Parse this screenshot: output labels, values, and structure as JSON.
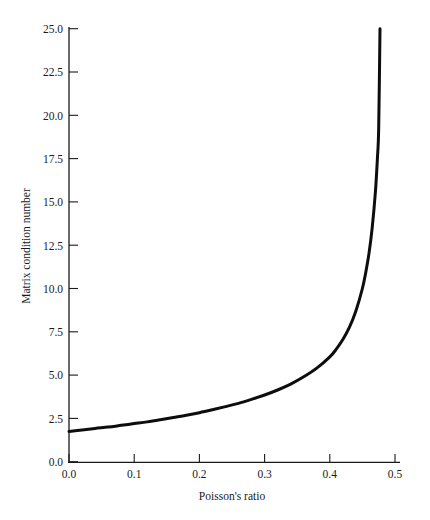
{
  "chart_data": {
    "type": "line",
    "title": "",
    "xlabel": "Poisson's ratio",
    "ylabel": "Matrix condition number",
    "xlim": [
      0.0,
      0.52
    ],
    "ylim": [
      0.0,
      25.0
    ],
    "xticks": [
      0.0,
      0.1,
      0.2,
      0.3,
      0.4,
      0.5
    ],
    "xtick_labels": [
      "0.0",
      "0.1",
      "0.2",
      "0.3",
      "0.4",
      "0.5"
    ],
    "yticks": [
      0.0,
      2.5,
      5.0,
      7.5,
      10.0,
      12.5,
      15.0,
      17.5,
      20.0,
      22.5,
      25.0
    ],
    "ytick_labels": [
      "0.0",
      "2.5",
      "5.0",
      "7.5",
      "10.0",
      "12.5",
      "15.0",
      "17.5",
      "20.0",
      "22.5",
      "25.0"
    ],
    "grid": false,
    "legend": null,
    "legend_position": "none",
    "series": [
      {
        "name": "Matrix condition number",
        "color": "#0d0d0d",
        "line_width": 3,
        "x": [
          0.0,
          0.02,
          0.04,
          0.06,
          0.08,
          0.1,
          0.12,
          0.14,
          0.16,
          0.18,
          0.2,
          0.22,
          0.24,
          0.26,
          0.28,
          0.3,
          0.32,
          0.34,
          0.36,
          0.38,
          0.4,
          0.41,
          0.42,
          0.43,
          0.44,
          0.45,
          0.455,
          0.46,
          0.465,
          0.47,
          0.473,
          0.475,
          0.477
        ],
        "values": [
          1.75,
          1.83,
          1.92,
          2.0,
          2.1,
          2.2,
          2.3,
          2.42,
          2.55,
          2.68,
          2.83,
          3.0,
          3.18,
          3.37,
          3.6,
          3.85,
          4.14,
          4.48,
          4.9,
          5.4,
          6.05,
          6.5,
          7.05,
          7.75,
          8.7,
          10.0,
          10.9,
          12.0,
          13.5,
          15.6,
          17.5,
          19.3,
          25.0
        ]
      }
    ],
    "annotations": []
  },
  "axes": {
    "x_axis_name": "Poisson's ratio",
    "y_axis_name": "Matrix condition number"
  }
}
